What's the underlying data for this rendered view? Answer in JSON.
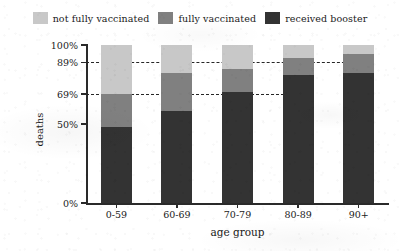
{
  "chart_data": {
    "type": "bar",
    "stacked": true,
    "title": "",
    "xlabel": "age group",
    "ylabel": "deaths",
    "categories": [
      "0-59",
      "60-69",
      "70-79",
      "80-89",
      "90+"
    ],
    "ylim": [
      0,
      100
    ],
    "yticks": [
      "0%",
      "50%",
      "69%",
      "89%",
      "100%"
    ],
    "ytick_values": [
      0,
      50,
      69,
      89,
      100
    ],
    "grid": false,
    "legend_position": "top-center",
    "series": [
      {
        "name": "received booster",
        "color": "#333333",
        "values": [
          48,
          58,
          70,
          81,
          82
        ]
      },
      {
        "name": "fully vaccinated",
        "color": "#808080",
        "values": [
          21,
          24,
          15,
          11,
          12
        ]
      },
      {
        "name": "not fully vaccinated",
        "color": "#c8c8c8",
        "values": [
          31,
          18,
          15,
          8,
          6
        ]
      }
    ],
    "cumulative_tops": {
      "received booster": [
        48,
        58,
        70,
        81,
        82
      ],
      "fully vaccinated": [
        69,
        82,
        85,
        92,
        94
      ],
      "not fully vaccinated": [
        100,
        100,
        100,
        100,
        100
      ]
    },
    "reference_lines": [
      {
        "value": 89,
        "label": "89%",
        "style": "dashed"
      },
      {
        "value": 69,
        "label": "69%",
        "style": "dashed"
      }
    ]
  }
}
